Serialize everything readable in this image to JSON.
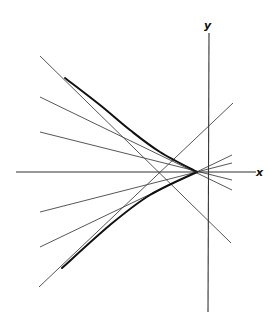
{
  "diagram": {
    "colors": {
      "background": "#ffffff",
      "axis": "#333333",
      "tangent": "#444444",
      "envelope": "#111111"
    },
    "axes": {
      "x": {
        "label": "x",
        "from": [
          16,
          172
        ],
        "to": [
          256,
          172
        ],
        "label_pos": [
          256,
          176
        ]
      },
      "y": {
        "label": "y",
        "from": [
          209,
          33
        ],
        "to": [
          208,
          312
        ],
        "label_pos": [
          204,
          29
        ]
      }
    },
    "cusp": [
      197,
      172
    ],
    "envelope": {
      "upper": [
        [
          65,
          78
        ],
        [
          100,
          105
        ],
        [
          130,
          130
        ],
        [
          160,
          152
        ],
        [
          197,
          172
        ]
      ],
      "lower": [
        [
          197,
          172
        ],
        [
          150,
          195
        ],
        [
          110,
          225
        ],
        [
          62,
          268
        ]
      ]
    },
    "tangent_lines": [
      {
        "from": [
          40,
          56
        ],
        "to": [
          231,
          243
        ]
      },
      {
        "from": [
          40,
          97
        ],
        "to": [
          232,
          190
        ]
      },
      {
        "from": [
          40,
          132
        ],
        "to": [
          232,
          180
        ]
      },
      {
        "from": [
          40,
          212
        ],
        "to": [
          232,
          163
        ]
      },
      {
        "from": [
          40,
          247
        ],
        "to": [
          232,
          155
        ]
      },
      {
        "from": [
          39,
          287
        ],
        "to": [
          233,
          103
        ]
      }
    ]
  }
}
